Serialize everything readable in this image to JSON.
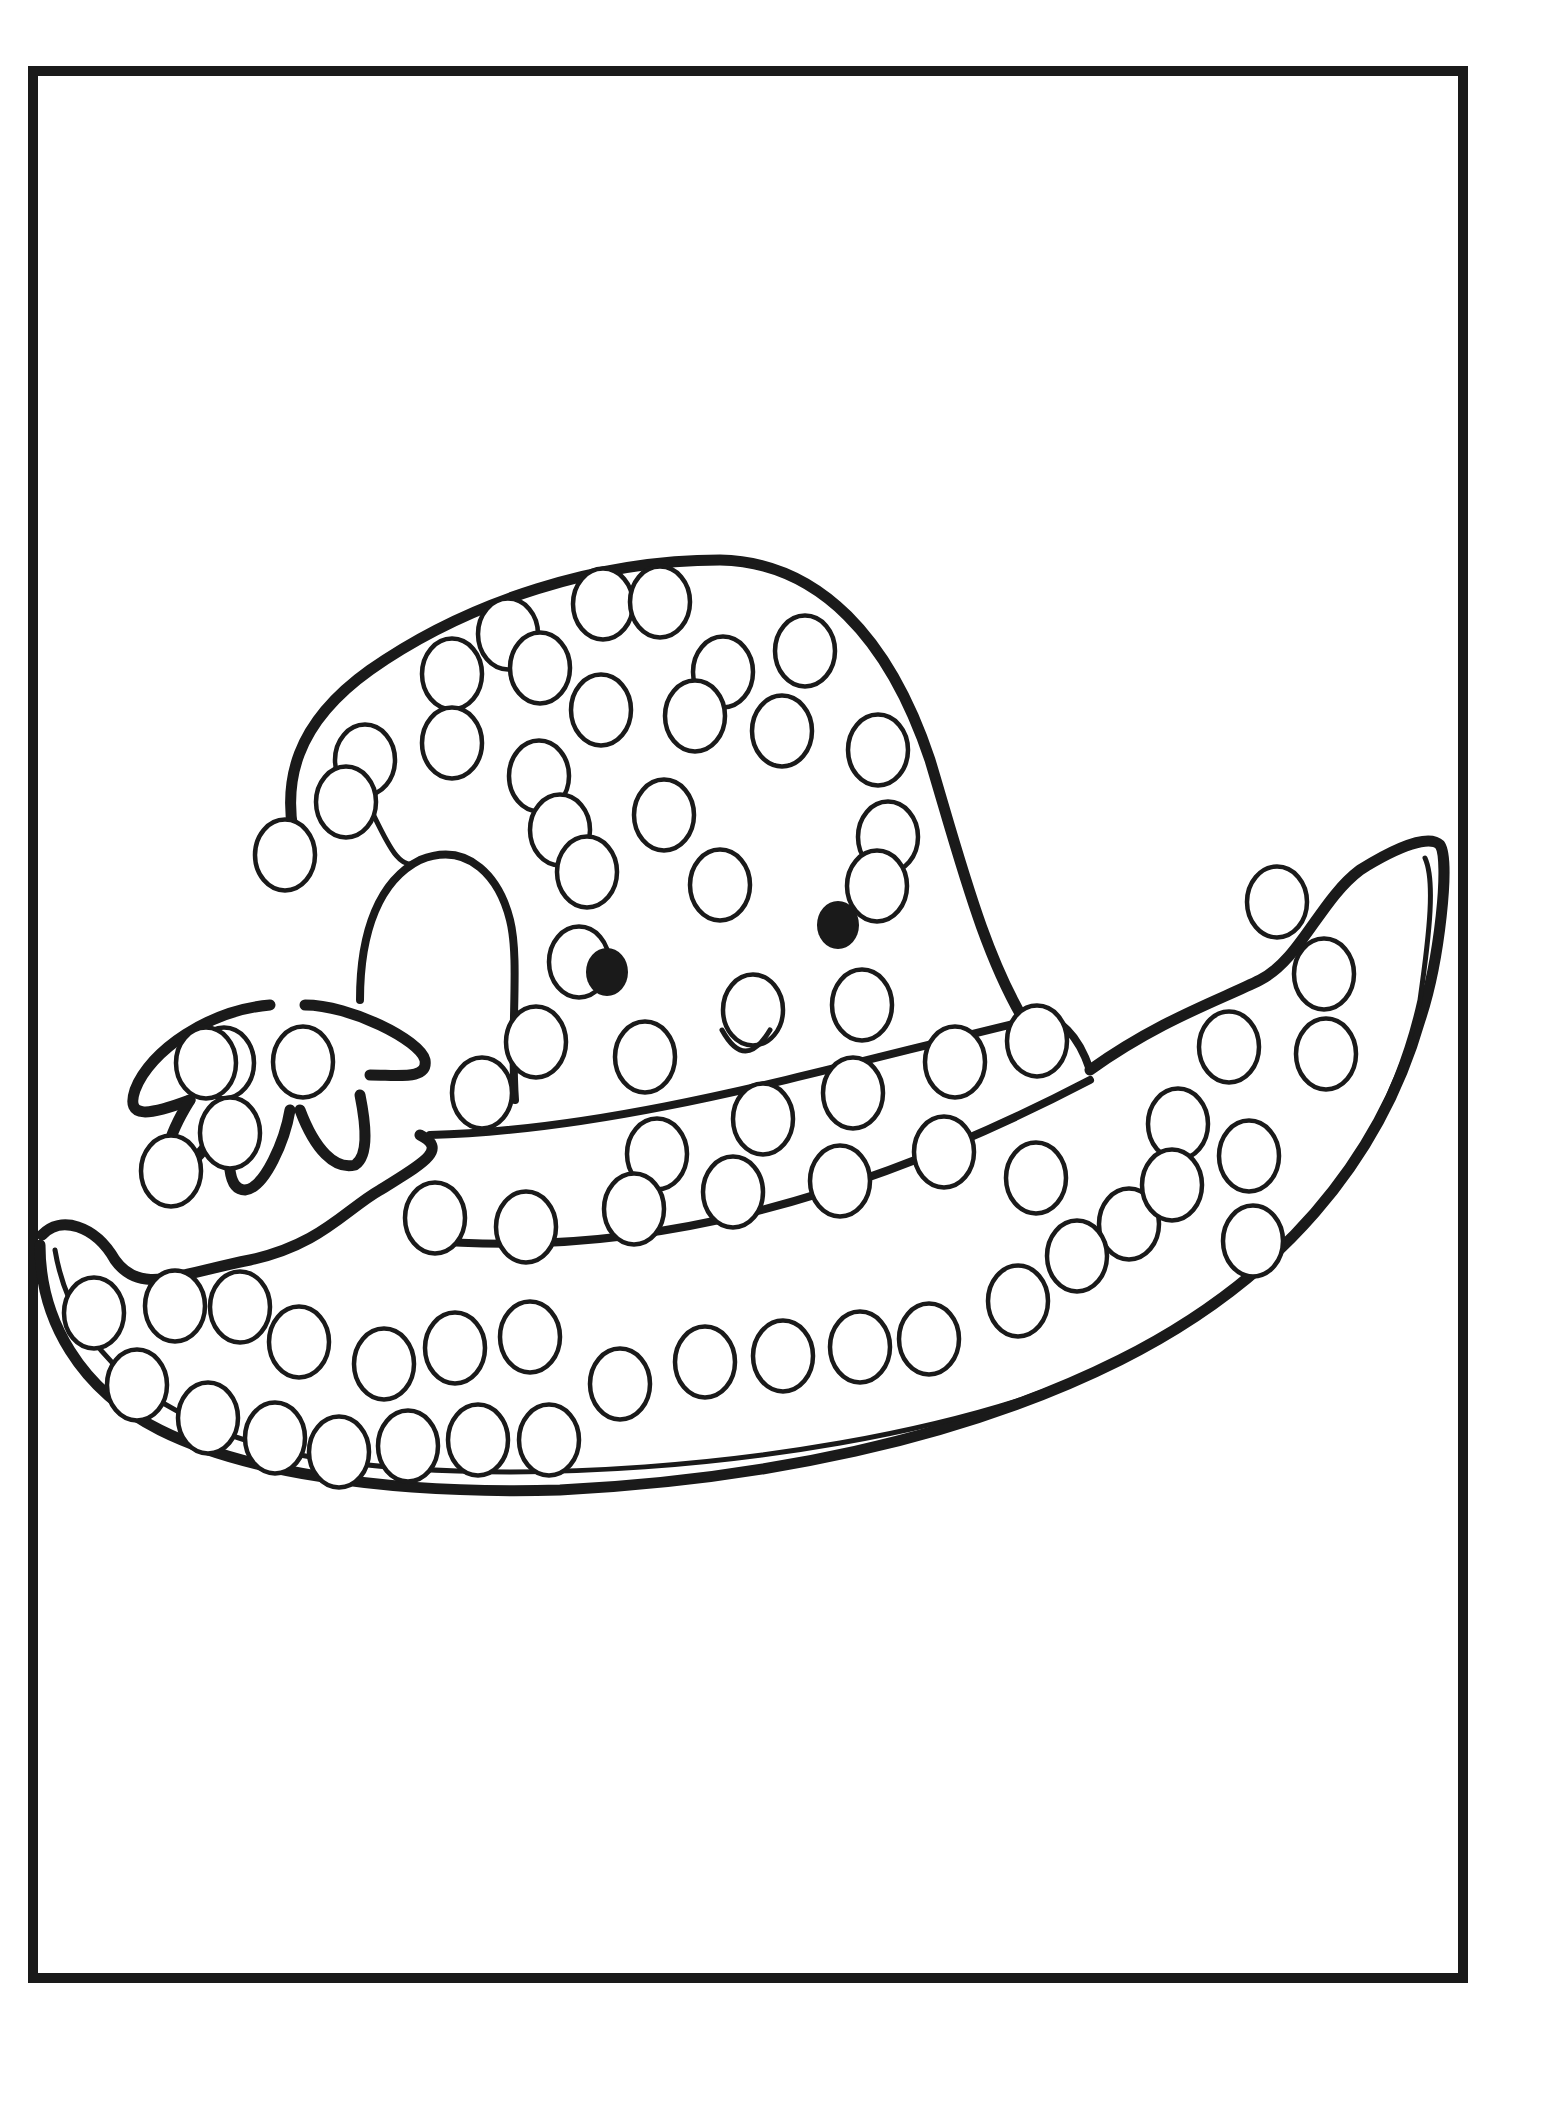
{
  "page": {
    "background": "#ffffff",
    "line_color": "#1a1a1a",
    "frame": {
      "x": 28,
      "y": 66,
      "width": 1440,
      "height": 1917,
      "stroke": 10
    }
  },
  "artwork": {
    "subject": "smiling witch hat with bow",
    "face": {
      "eyes": [
        {
          "cx": 607,
          "cy": 972,
          "rx": 21,
          "ry": 24
        },
        {
          "cx": 838,
          "cy": 925,
          "rx": 21,
          "ry": 24
        }
      ],
      "smile": "M 722 1030 Q 745 1072 770 1030"
    },
    "dots": [
      {
        "cx": 508,
        "cy": 634,
        "r": 30
      },
      {
        "cx": 603,
        "cy": 604,
        "r": 30
      },
      {
        "cx": 660,
        "cy": 602,
        "r": 30
      },
      {
        "cx": 452,
        "cy": 674,
        "r": 30
      },
      {
        "cx": 540,
        "cy": 668,
        "r": 30
      },
      {
        "cx": 723,
        "cy": 672,
        "r": 30
      },
      {
        "cx": 805,
        "cy": 651,
        "r": 30
      },
      {
        "cx": 365,
        "cy": 760,
        "r": 30
      },
      {
        "cx": 452,
        "cy": 743,
        "r": 30
      },
      {
        "cx": 539,
        "cy": 776,
        "r": 30
      },
      {
        "cx": 601,
        "cy": 710,
        "r": 30
      },
      {
        "cx": 695,
        "cy": 716,
        "r": 30
      },
      {
        "cx": 782,
        "cy": 731,
        "r": 30
      },
      {
        "cx": 878,
        "cy": 750,
        "r": 30
      },
      {
        "cx": 346,
        "cy": 802,
        "r": 30
      },
      {
        "cx": 560,
        "cy": 830,
        "r": 30
      },
      {
        "cx": 664,
        "cy": 815,
        "r": 30
      },
      {
        "cx": 285,
        "cy": 855,
        "r": 30
      },
      {
        "cx": 587,
        "cy": 872,
        "r": 30
      },
      {
        "cx": 720,
        "cy": 885,
        "r": 30
      },
      {
        "cx": 888,
        "cy": 837,
        "r": 30
      },
      {
        "cx": 579,
        "cy": 962,
        "r": 30
      },
      {
        "cx": 877,
        "cy": 886,
        "r": 30
      },
      {
        "cx": 536,
        "cy": 1042,
        "r": 30
      },
      {
        "cx": 645,
        "cy": 1057,
        "r": 30
      },
      {
        "cx": 753,
        "cy": 1010,
        "r": 30
      },
      {
        "cx": 862,
        "cy": 1005,
        "r": 30
      },
      {
        "cx": 955,
        "cy": 1062,
        "r": 30
      },
      {
        "cx": 224,
        "cy": 1063,
        "r": 30
      },
      {
        "cx": 303,
        "cy": 1062,
        "r": 30
      },
      {
        "cx": 482,
        "cy": 1093,
        "r": 30
      },
      {
        "cx": 657,
        "cy": 1154,
        "r": 30
      },
      {
        "cx": 763,
        "cy": 1119,
        "r": 30
      },
      {
        "cx": 853,
        "cy": 1093,
        "r": 30
      },
      {
        "cx": 944,
        "cy": 1152,
        "r": 30
      },
      {
        "cx": 1037,
        "cy": 1041,
        "r": 30
      },
      {
        "cx": 1229,
        "cy": 1047,
        "r": 30
      },
      {
        "cx": 1277,
        "cy": 902,
        "r": 30
      },
      {
        "cx": 1326,
        "cy": 1054,
        "r": 30
      },
      {
        "cx": 1324,
        "cy": 974,
        "r": 30
      },
      {
        "cx": 1178,
        "cy": 1124,
        "r": 30
      },
      {
        "cx": 1129,
        "cy": 1224,
        "r": 30
      },
      {
        "cx": 1036,
        "cy": 1178,
        "r": 30
      },
      {
        "cx": 1077,
        "cy": 1256,
        "r": 30
      },
      {
        "cx": 1172,
        "cy": 1185,
        "r": 30
      },
      {
        "cx": 1249,
        "cy": 1156,
        "r": 30
      },
      {
        "cx": 1253,
        "cy": 1241,
        "r": 30
      },
      {
        "cx": 929,
        "cy": 1339,
        "r": 30
      },
      {
        "cx": 1018,
        "cy": 1301,
        "r": 30
      },
      {
        "cx": 435,
        "cy": 1218,
        "r": 30
      },
      {
        "cx": 526,
        "cy": 1227,
        "r": 30
      },
      {
        "cx": 634,
        "cy": 1209,
        "r": 30
      },
      {
        "cx": 733,
        "cy": 1192,
        "r": 30
      },
      {
        "cx": 840,
        "cy": 1181,
        "r": 30
      },
      {
        "cx": 94,
        "cy": 1313,
        "r": 30
      },
      {
        "cx": 175,
        "cy": 1306,
        "r": 30
      },
      {
        "cx": 240,
        "cy": 1307,
        "r": 30
      },
      {
        "cx": 299,
        "cy": 1342,
        "r": 30
      },
      {
        "cx": 384,
        "cy": 1364,
        "r": 30
      },
      {
        "cx": 455,
        "cy": 1348,
        "r": 30
      },
      {
        "cx": 530,
        "cy": 1337,
        "r": 30
      },
      {
        "cx": 620,
        "cy": 1384,
        "r": 30
      },
      {
        "cx": 705,
        "cy": 1362,
        "r": 30
      },
      {
        "cx": 783,
        "cy": 1356,
        "r": 30
      },
      {
        "cx": 860,
        "cy": 1347,
        "r": 30
      },
      {
        "cx": 137,
        "cy": 1385,
        "r": 30
      },
      {
        "cx": 208,
        "cy": 1418,
        "r": 30
      },
      {
        "cx": 275,
        "cy": 1438,
        "r": 30
      },
      {
        "cx": 339,
        "cy": 1452,
        "r": 30
      },
      {
        "cx": 408,
        "cy": 1446,
        "r": 30
      },
      {
        "cx": 478,
        "cy": 1440,
        "r": 30
      },
      {
        "cx": 549,
        "cy": 1440,
        "r": 30
      },
      {
        "cx": 230,
        "cy": 1133,
        "r": 30
      },
      {
        "cx": 171,
        "cy": 1171,
        "r": 30
      },
      {
        "cx": 206,
        "cy": 1063,
        "r": 30
      }
    ]
  }
}
